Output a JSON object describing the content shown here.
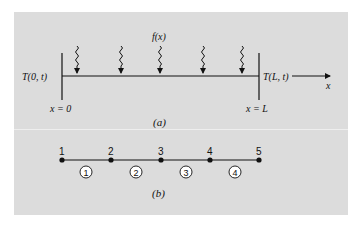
{
  "figure": {
    "part_a": {
      "caption": "(a)",
      "source_label": "f(x)",
      "left_boundary_label": "T(0, t)",
      "right_boundary_label": "T(L, t)",
      "left_position_label": "x = 0",
      "right_position_label": "x = L",
      "axis_label": "x",
      "heat_arrow_count": 5
    },
    "part_b": {
      "caption": "(b)",
      "nodes": [
        "1",
        "2",
        "3",
        "4",
        "5"
      ],
      "elements": [
        "1",
        "2",
        "3",
        "4"
      ]
    }
  },
  "colors": {
    "panel_background": "#dcdcdc",
    "separator": "#eeeeee",
    "ink": "#111111",
    "element_circle_fill": "#ffffff"
  }
}
